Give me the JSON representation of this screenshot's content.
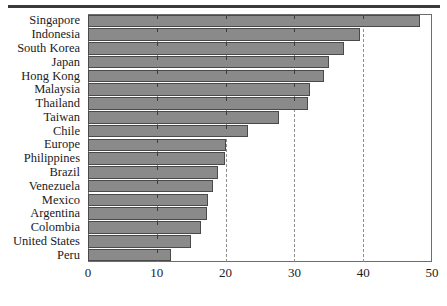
{
  "figure": {
    "background_color": "#ffffff",
    "rule_color": "#3a3a3a",
    "bar_fill_color": "#8a8a8a",
    "bar_edge_color": "#4a4a4a",
    "gridline_color": "#8f8f8f",
    "axis_color": "#6d6d6d",
    "text_color": "#1b1b1b"
  },
  "chart_data": {
    "type": "bar",
    "orientation": "horizontal",
    "title": "",
    "xlabel": "",
    "ylabel": "",
    "xlim": [
      0,
      50
    ],
    "xticks": [
      0,
      10,
      20,
      30,
      40,
      50
    ],
    "xticklabels": [
      "0",
      "10",
      "20",
      "30",
      "40",
      "50"
    ],
    "grid": true,
    "grid_axis": "x",
    "grid_style": "dashed",
    "legend": false,
    "categories": [
      "Singapore",
      "Indonesia",
      "South Korea",
      "Japan",
      "Hong Kong",
      "Malaysia",
      "Thailand",
      "Taiwan",
      "Chile",
      "Europe",
      "Philippines",
      "Brazil",
      "Venezuela",
      "Mexico",
      "Argentina",
      "Colombia",
      "United States",
      "Peru"
    ],
    "values": [
      48.2,
      39.6,
      37.2,
      35.0,
      34.3,
      32.2,
      32.0,
      27.8,
      23.3,
      20.0,
      19.9,
      18.9,
      18.1,
      17.4,
      17.3,
      16.4,
      15.0,
      12.1
    ]
  }
}
